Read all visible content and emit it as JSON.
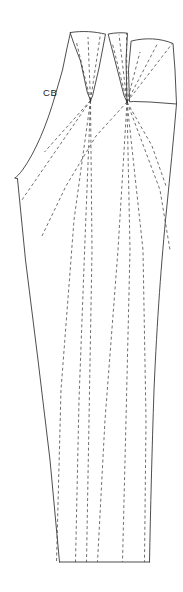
{
  "figure": {
    "kind": "sewing-pattern-draft",
    "technique": "slash-and-spread",
    "canvas": {
      "width": 183,
      "height": 592
    },
    "background_color": "#ffffff",
    "outline_color": "#3a3a3a",
    "slash_line_color": "#4a4a4a",
    "outline_width": 0.9,
    "slash_line_width": 0.8,
    "slash_dash_pattern": "3,2.6"
  },
  "labels": [
    {
      "name": "center-back-label",
      "text": "CB",
      "x": 43,
      "y": 96,
      "font_size": 9.5,
      "color": "#1a1a1a"
    }
  ],
  "pivots": [
    {
      "name": "pivot-left",
      "x": 90.5,
      "y": 100.5
    },
    {
      "name": "pivot-right",
      "x": 127.0,
      "y": 102.0
    }
  ],
  "outline_paths": [
    {
      "name": "panel-one-outline",
      "d": "M 70.5 32.5 C 83 30.6 95 31.6 105.5 34.2 L 99.0 68.0 L 92.5 96.0 L 90.5 100.5 L 87.2 92.0 L 80.5 61.0 L 74.0 44.0 Z"
    },
    {
      "name": "panel-two-outline",
      "d": "M 108.5 34.0 C 115.5 32.6 122.0 32.4 127.5 33.2 L 126.0 60.0 L 127.0 102.0 L 124.0 95.5 L 117.0 68.5 L 111.5 47.0 Z"
    },
    {
      "name": "panel-three-outline",
      "d": "M 131.5 41.0 C 145.5 37.4 160.5 38.2 173.0 43.5 L 175.0 70.0 L 176.5 104.0 L 150.0 102.0 L 133.5 101.5 L 129.5 101.8 L 128.5 70.0 Z"
    },
    {
      "name": "center-back-edge",
      "d": "M 70.5 32.5 L 67.0 48.0 L 62.5 70.0 L 55.0 96.0 C 47.0 124.0 35.5 152.0 22.5 170.0 C 19.5 174.0 17.0 176.5 15.0 178.0"
    },
    {
      "name": "waist-edge-left",
      "d": "M 15.0 178.0 L 17.5 178.8"
    },
    {
      "name": "side-seam-left",
      "d": "M 17.5 178.8 L 25.5 260.0 L 38.0 360.0 L 50.0 460.0 L 59.5 562.0"
    },
    {
      "name": "hem-edge",
      "d": "M 59.5 562.0 L 149.5 562.0"
    },
    {
      "name": "side-seam-right",
      "d": "M 176.5 104.0 C 173.5 140.0 170.0 175.0 166.5 210.0 C 161.5 260.0 157.0 320.0 154.0 390.0 C 152.0 450.0 150.5 510.0 149.5 562.0"
    }
  ],
  "slash_lines": [
    {
      "name": "slash-line-1",
      "d": "M 90.5 100.5 L 76.5 42.5"
    },
    {
      "name": "slash-line-2",
      "d": "M 90.5 100.5 L 88.0 37.0"
    },
    {
      "name": "slash-line-3",
      "d": "M 90.5 100.5 L 100.5 33.8"
    },
    {
      "name": "slash-line-4",
      "d": "M 127.0 102.0 L 112.5 44.0"
    },
    {
      "name": "slash-line-5",
      "d": "M 127.0 102.0 L 119.0 34.5"
    },
    {
      "name": "slash-line-6",
      "d": "M 127.0 102.0 L 126.5 33.4"
    },
    {
      "name": "slash-line-7",
      "d": "M 127.0 102.0 L 140.0 52.0"
    },
    {
      "name": "slash-line-8",
      "d": "M 127.0 102.0 L 157.0 44.5"
    },
    {
      "name": "slash-line-9",
      "d": "M 127.0 102.0 L 172.5 43.2"
    },
    {
      "name": "slash-line-10",
      "d": "M 90.5 100.5 L 44.5 152.0"
    },
    {
      "name": "slash-line-11",
      "d": "M 90.5 100.5 L 20.5 202.0"
    },
    {
      "name": "slash-line-12",
      "d": "M 127.0 102.0 L 96.0 136.0 L 66.0 186.0 L 42.0 236.0"
    },
    {
      "name": "slash-line-13",
      "d": "M 127.0 102.0 L 152.0 146.0 L 166.0 186.0"
    },
    {
      "name": "slash-line-14",
      "d": "M 127.0 102.0 L 160.0 190.0 L 170.0 250.0"
    },
    {
      "name": "slash-line-15",
      "d": "M 90.5 100.5 L 74.0 220.0 L 61.0 390.0 L 56.5 562.0"
    },
    {
      "name": "slash-line-16",
      "d": "M 90.5 100.5 L 85.0 240.0 L 79.0 400.0 L 75.5 562.0"
    },
    {
      "name": "slash-line-17",
      "d": "M 90.5 100.5 L 92.0 250.0 L 89.0 420.0 L 86.5 562.0"
    },
    {
      "name": "slash-line-18",
      "d": "M 127.0 102.0 L 118.0 250.0 L 105.0 420.0 L 97.5 562.0"
    },
    {
      "name": "slash-line-19",
      "d": "M 127.0 102.0 L 130.0 250.0 L 126.0 420.0 L 122.5 562.0"
    },
    {
      "name": "slash-line-20",
      "d": "M 127.0 102.0 L 143.0 250.0 L 146.0 420.0 L 144.5 562.0"
    }
  ]
}
